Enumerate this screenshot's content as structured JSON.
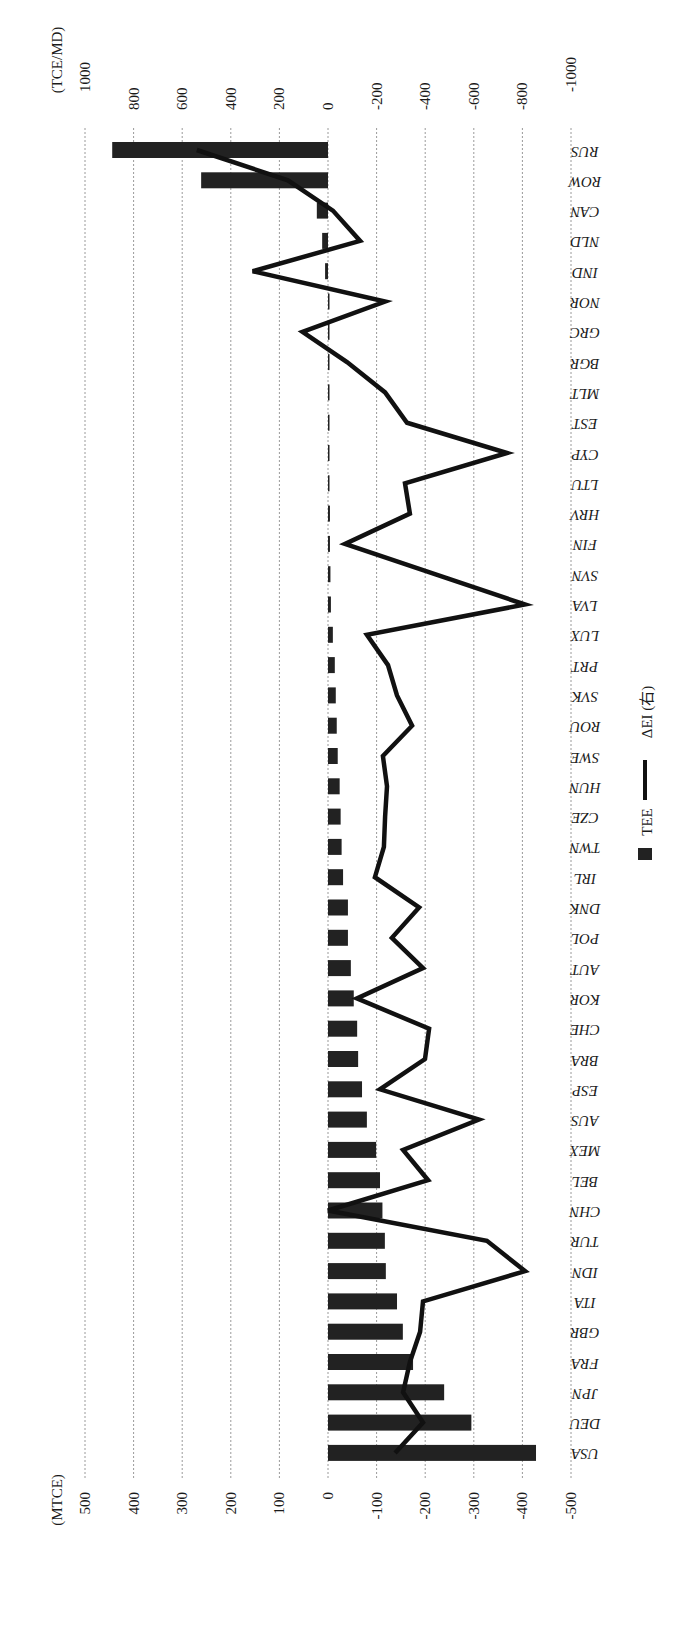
{
  "chart_data": {
    "type": "bar",
    "orientation_note": "figure is rotated 90 degrees clockwise; categories run top-to-bottom",
    "title": "",
    "categories": [
      "RUS",
      "ROW",
      "CAN",
      "NLD",
      "IND",
      "NOR",
      "GRC",
      "BGR",
      "MLT",
      "EST",
      "CYP",
      "LTU",
      "HRV",
      "FIN",
      "SVN",
      "LVA",
      "LUX",
      "PRT",
      "SVK",
      "ROU",
      "SWE",
      "HUN",
      "CZE",
      "TWN",
      "IRL",
      "DNK",
      "POL",
      "AUT",
      "KOR",
      "CHE",
      "BRA",
      "ESP",
      "AUS",
      "MEX",
      "BEL",
      "CHN",
      "TUR",
      "IDN",
      "ITA",
      "GBR",
      "FRA",
      "JPN",
      "DEU",
      "USA"
    ],
    "series": [
      {
        "name": "TEE",
        "type": "bar",
        "axis": "left",
        "color": "#222222",
        "values": [
          444,
          261,
          23,
          12,
          6,
          -1,
          -1,
          -2,
          -2,
          -2,
          -3,
          -3,
          -4,
          -4,
          -5,
          -6,
          -10,
          -14,
          -16,
          -18,
          -20,
          -24,
          -26,
          -28,
          -31,
          -41,
          -41,
          -47,
          -53,
          -60,
          -62,
          -70,
          -80,
          -99,
          -107,
          -112,
          -117,
          -119,
          -142,
          -154,
          -175,
          -239,
          -295,
          -428
        ]
      },
      {
        "name": "ΔEI (右)",
        "type": "line",
        "axis": "right",
        "color": "#111111",
        "values": [
          540,
          165,
          -20,
          -132,
          310,
          -235,
          105,
          -78,
          -235,
          -325,
          -737,
          -317,
          -337,
          -70,
          -440,
          -811,
          -160,
          -247,
          -284,
          -346,
          -226,
          -243,
          -235,
          -230,
          -193,
          -375,
          -263,
          -391,
          -119,
          -416,
          -399,
          -214,
          -621,
          -309,
          -412,
          0,
          -654,
          -811,
          -391,
          -379,
          -337,
          -309,
          -391,
          -276
        ]
      }
    ],
    "left_axis": {
      "label": "(MTCE)",
      "ylim": [
        -500,
        500
      ],
      "ticks": [
        500,
        400,
        300,
        200,
        100,
        0,
        -100,
        -200,
        -300,
        -400,
        -500
      ],
      "tick_labels": [
        "500",
        "400",
        "300",
        "200",
        "100",
        "0",
        "-100",
        "-200",
        "-300",
        "-400",
        "-500"
      ]
    },
    "right_axis": {
      "label": "(TCE/MD)",
      "ylim": [
        -1000,
        1000
      ],
      "ticks": [
        1000,
        800,
        600,
        400,
        200,
        0,
        -200,
        -400,
        -600,
        -800,
        -1000
      ],
      "tick_labels": [
        "1000",
        "800",
        "600",
        "400",
        "200",
        "0",
        "-200",
        "-400",
        "-600",
        "-800",
        "-1000"
      ]
    },
    "grid": true,
    "grid_style": "dashed",
    "legend": {
      "position": "right (bottom of unrotated chart)",
      "entries": [
        {
          "label": "TEE",
          "marker": "square"
        },
        {
          "label": "ΔEI (右)",
          "marker": "line"
        }
      ]
    },
    "xlabel": "",
    "ylabel": "(MTCE)",
    "ylabel_right": "(TCE/MD)"
  },
  "labels": {
    "left_unit": "(MTCE)",
    "right_unit": "(TCE/MD)",
    "legend_tee": "TEE",
    "legend_dei": "ΔEI (右)"
  }
}
